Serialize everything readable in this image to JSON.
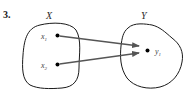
{
  "problem_number": "3.",
  "sets": {
    "domain": {
      "label": "X",
      "elements": [
        {
          "name": "x",
          "subscript": "1"
        },
        {
          "name": "x",
          "subscript": "2"
        }
      ]
    },
    "codomain": {
      "label": "Y",
      "elements": [
        {
          "name": "y",
          "subscript": "1"
        }
      ]
    }
  },
  "mappings": [
    {
      "from": "x1",
      "to": "y1"
    },
    {
      "from": "x2",
      "to": "y1"
    }
  ],
  "colors": {
    "outline": "#1a1a1a",
    "arrow": "#555555",
    "dot": "#000000"
  }
}
